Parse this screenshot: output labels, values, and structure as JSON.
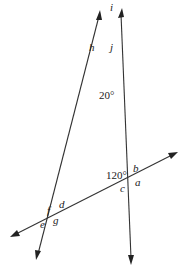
{
  "diagram": {
    "lines": [
      {
        "name": "left-line",
        "from": [
          37,
          258
        ],
        "to": [
          100,
          12
        ]
      },
      {
        "name": "right-line",
        "from": [
          131,
          265
        ],
        "to": [
          122,
          9
        ]
      },
      {
        "name": "transversal",
        "from": [
          12,
          236
        ],
        "to": [
          177,
          152
        ]
      }
    ],
    "intersections": {
      "top": [
        104,
        45
      ],
      "right": [
        122,
        183
      ],
      "left": [
        56,
        215
      ]
    },
    "angle_labels": {
      "i": "i",
      "h": "h",
      "j": "j",
      "angle_20": "20°",
      "angle_120": "120°",
      "b": "b",
      "a": "a",
      "c": "c",
      "f": "f",
      "d": "d",
      "e": "e",
      "g": "g"
    }
  }
}
